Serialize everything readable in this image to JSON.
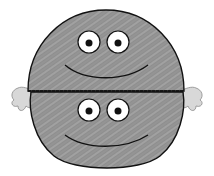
{
  "illustration": {
    "subject": "smiley ball split in two halves with hands",
    "colors": {
      "background": "#ffffff",
      "body_fill": "#8e8e8e",
      "hatch": "#c8c8c8",
      "outline": "#111111",
      "eye_white": "#ffffff",
      "pupil": "#111111",
      "hand_fill": "#d8d8d8",
      "hand_shadow": "#9a9a9a"
    },
    "top_half": {
      "label": "top-face"
    },
    "bottom_half": {
      "label": "bottom-face"
    }
  }
}
